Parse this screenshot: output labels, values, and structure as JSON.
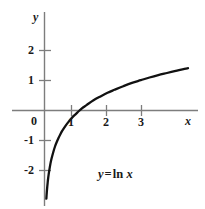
{
  "figure": {
    "background_color": "#ffffff",
    "axis_color": "#7d7d7d",
    "curve_color": "#111111",
    "text_color": "#1a1a1a",
    "width": 205,
    "height": 209
  },
  "caption": {
    "y_symbol": "y",
    "equals": "=",
    "function": "ln",
    "x_symbol": "x",
    "full_text": "y = ln x"
  },
  "axis_names": {
    "x": "x",
    "y": "y"
  },
  "chart_data": {
    "type": "line",
    "title": "",
    "subtitle": "",
    "xlabel": "x",
    "ylabel": "y",
    "annotations": [
      "y = ln x"
    ],
    "legend": [],
    "legend_position": "none",
    "grid": false,
    "xlim": [
      -0.9,
      4.45
    ],
    "ylim": [
      -3.2,
      3.2
    ],
    "xticks": [
      1,
      2,
      3
    ],
    "xtick_labels": [
      "1",
      "2",
      "3"
    ],
    "yticks": [
      -2,
      -1,
      1,
      2
    ],
    "ytick_labels": [
      "-2",
      "-1",
      "1",
      "2"
    ],
    "origin_label": "0",
    "series": [
      {
        "name": "y = ln x",
        "color": "#111111",
        "x": [
          0.053,
          0.06,
          0.07,
          0.08,
          0.09,
          0.1,
          0.12,
          0.14,
          0.17,
          0.2,
          0.25,
          0.3,
          0.35,
          0.4,
          0.45,
          0.5,
          0.6,
          0.7,
          0.8,
          0.9,
          1.0,
          1.1,
          1.2,
          1.4,
          1.6,
          1.8,
          2.0,
          2.25,
          2.5,
          2.75,
          3.0,
          3.25,
          3.5,
          3.75,
          4.0,
          4.1
        ],
        "y": [
          -2.94,
          -2.81,
          -2.66,
          -2.53,
          -2.41,
          -2.3,
          -2.12,
          -1.97,
          -1.77,
          -1.61,
          -1.39,
          -1.2,
          -1.05,
          -0.92,
          -0.8,
          -0.69,
          -0.51,
          -0.36,
          -0.22,
          -0.11,
          0.0,
          0.1,
          0.18,
          0.34,
          0.47,
          0.59,
          0.69,
          0.81,
          0.92,
          1.01,
          1.1,
          1.18,
          1.25,
          1.32,
          1.39,
          1.41
        ]
      }
    ]
  }
}
